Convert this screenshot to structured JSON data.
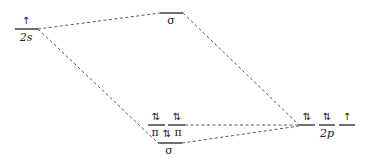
{
  "diagram": {
    "type": "molecular-orbital-energy-diagram",
    "left_atom": {
      "levels": [
        {
          "id": "2s",
          "label": "2s",
          "electrons": "↑",
          "x1": 15,
          "x2": 38,
          "y": 29
        }
      ]
    },
    "molecular_orbitals": [
      {
        "id": "sigma-star",
        "label": "σ",
        "electrons": "",
        "x1": 160,
        "x2": 183,
        "y": 13
      },
      {
        "id": "pi-1",
        "label": "π",
        "electrons": "⇅",
        "x1": 148,
        "x2": 165,
        "y": 125
      },
      {
        "id": "pi-2",
        "label": "π",
        "electrons": "⇅",
        "x1": 168,
        "x2": 185,
        "y": 125
      },
      {
        "id": "sigma",
        "label": "σ",
        "electrons": "⇅",
        "x1": 158,
        "x2": 182,
        "y": 143
      }
    ],
    "right_atom": {
      "group_label": "2p",
      "levels": [
        {
          "id": "2p-1",
          "electrons": "⇅",
          "x1": 299,
          "x2": 315,
          "y": 125
        },
        {
          "id": "2p-2",
          "electrons": "⇅",
          "x1": 319,
          "x2": 335,
          "y": 125
        },
        {
          "id": "2p-3",
          "electrons": "↑",
          "x1": 339,
          "x2": 355,
          "y": 125
        }
      ]
    },
    "connections": [
      {
        "from": "2s",
        "to": "sigma-star"
      },
      {
        "from": "2s",
        "to": "sigma"
      },
      {
        "from": "sigma-star",
        "to": "2p"
      },
      {
        "from": "pi-2",
        "to": "2p"
      },
      {
        "from": "sigma",
        "to": "2p"
      }
    ],
    "colors": {
      "line": "#222222",
      "dash": "#444444",
      "background": "#ffffff"
    }
  },
  "labels": {
    "2s": "2s",
    "sigma_top": "σ",
    "pi_1": "π",
    "pi_2": "π",
    "sigma_bottom": "σ",
    "2p": "2p"
  },
  "electrons": {
    "2s": "↑",
    "pi_1": "⇅",
    "pi_2": "⇅",
    "sigma_bottom": "⇅",
    "2p_1": "⇅",
    "2p_2": "⇅",
    "2p_3": "↑"
  }
}
